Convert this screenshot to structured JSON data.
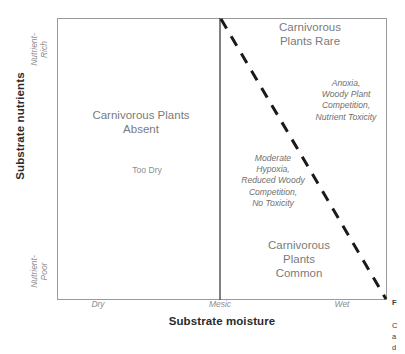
{
  "figure": {
    "type": "conceptual-diagram",
    "axes": {
      "x": {
        "title": "Substrate moisture",
        "ticks": [
          "Dry",
          "Mesic",
          "Wet"
        ]
      },
      "y": {
        "title": "Substrate nutrients",
        "ticks": [
          "Nutrient-\nRich",
          "Nutrient-\nPoor"
        ]
      }
    },
    "zones": [
      {
        "id": "absent",
        "label": "Carnivorous Plants\nAbsent"
      },
      {
        "id": "rare",
        "label": "Carnivorous\nPlants Rare"
      },
      {
        "id": "common",
        "label": "Carnivorous\nPlants\nCommon"
      }
    ],
    "notes": {
      "too_dry": "Too Dry",
      "wet_rich": "Anoxia,\nWoody Plant\nCompetition,\nNutrient Toxicity",
      "moderate": "Moderate\nHypoxia,\nReduced Woody\nCompetition,\nNo Toxicity"
    },
    "caption_stub": {
      "head": "F",
      "lines": "C\na\nd"
    },
    "colors": {
      "frame": "#9a9a9a",
      "divider": "#4a4a4a",
      "threshold": "#1a1a1a",
      "text": "#7b7b7b",
      "title": "#2b2b2b"
    }
  }
}
